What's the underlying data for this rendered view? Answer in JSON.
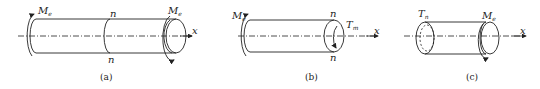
{
  "figures": [
    {
      "id": "a",
      "caption": "(a)",
      "labels": {
        "moment_left": {
          "main": "M",
          "sub": "e"
        },
        "moment_right": {
          "main": "M",
          "sub": "e"
        },
        "section_top": "n",
        "section_bottom": "n",
        "axis": "x"
      }
    },
    {
      "id": "b",
      "caption": "(b)",
      "labels": {
        "moment_left": {
          "main": "M",
          "sub": "e"
        },
        "internal_torque": {
          "main": "T",
          "sub": "m"
        },
        "section_top": "n",
        "section_bottom": "n",
        "axis": "x"
      }
    },
    {
      "id": "c",
      "caption": "(c)",
      "labels": {
        "internal_torque": {
          "main": "T",
          "sub": "n"
        },
        "moment_right": {
          "main": "M",
          "sub": "e"
        },
        "axis": "x"
      }
    }
  ],
  "colors": {
    "stroke": "#222222",
    "background": "#ffffff"
  }
}
